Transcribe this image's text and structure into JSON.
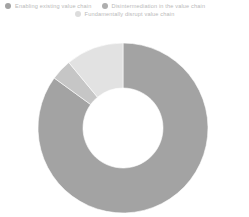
{
  "chart_data": {
    "type": "pie",
    "variant": "donut",
    "title": "",
    "subtitle": "",
    "xlabel": "",
    "ylabel": "",
    "legend_position": "top",
    "grid": false,
    "categories": [
      "Enabling existing value chain",
      "Disintermediation in the value chain",
      "Fundamentally disrupt value chain"
    ],
    "values": [
      85,
      4,
      11
    ],
    "colors": [
      "#a3a3a3",
      "#c6c6c6",
      "#e2e2e2"
    ],
    "slices": [
      {
        "label": "Enabling existing value chain",
        "value": 85,
        "color": "#a3a3a3",
        "start_angle": 0,
        "end_angle": 306
      },
      {
        "label": "Disintermediation in the value chain",
        "value": 4,
        "color": "#c6c6c6",
        "start_angle": 306,
        "end_angle": 320.4
      },
      {
        "label": "Fundamentally disrupt value chain",
        "value": 11,
        "color": "#e2e2e2",
        "start_angle": 320.4,
        "end_angle": 360
      }
    ],
    "inner_radius": 40,
    "outer_radius": 85,
    "center_x": 123,
    "center_y": 128
  },
  "legend": {
    "row1": [
      {
        "label": "Enabling existing value chain",
        "color": "#a3a3a3"
      },
      {
        "label": "Disintermediation in the value chain",
        "color": "#aeaeae"
      }
    ],
    "row2": [
      {
        "label": "Fundamentally disrupt value chain",
        "color": "#dcdcdc"
      }
    ]
  }
}
